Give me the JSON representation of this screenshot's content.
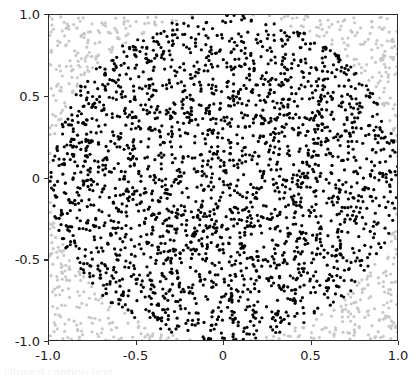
{
  "figure": {
    "background_color": "#ffffff",
    "axes_color": "#2b2b2b",
    "caption_sliver": "clipped caption text"
  },
  "chart_data": {
    "type": "scatter",
    "title": "",
    "xlabel": "",
    "ylabel": "",
    "xlim": [
      -1.0,
      1.0
    ],
    "ylim": [
      -1.0,
      1.0
    ],
    "grid": false,
    "legend": null,
    "xticks": [
      -1.0,
      -0.5,
      0,
      0.5,
      1.0
    ],
    "xticklabels": [
      "-1.0",
      "-0.5",
      "0",
      "0.5",
      "1.0"
    ],
    "yticks": [
      -1.0,
      -0.5,
      0,
      0.5,
      1.0
    ],
    "yticklabels": [
      "-1.0",
      "-0.5",
      "0",
      "0.5",
      "1.0"
    ],
    "total_points": 3000,
    "marker_shape": "circle",
    "marker_size_px": 3.2,
    "series": [
      {
        "name": "inside-unit-circle",
        "color": "#000000",
        "condition": "x^2 + y^2 <= 1",
        "approx_count": 2356
      },
      {
        "name": "outside-unit-circle",
        "color": "#c8c8c8",
        "condition": "x^2 + y^2 > 1",
        "approx_count": 644
      }
    ],
    "boundary": {
      "shape": "circle",
      "center": [
        0,
        0
      ],
      "radius": 1.0
    },
    "random_seed": 20240617
  }
}
